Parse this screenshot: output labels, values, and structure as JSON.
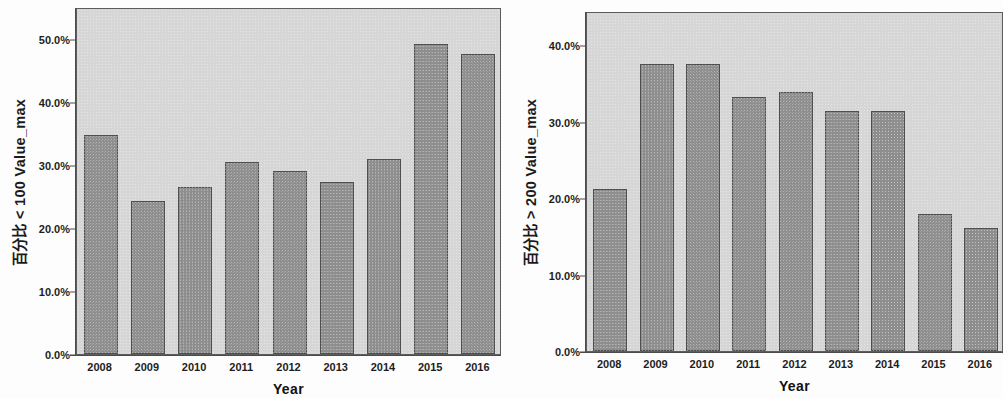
{
  "chart_data": [
    {
      "type": "bar",
      "panel": "left",
      "title": "",
      "categories": [
        "2008",
        "2009",
        "2010",
        "2011",
        "2012",
        "2013",
        "2014",
        "2015",
        "2016"
      ],
      "values": [
        34.7,
        24.3,
        26.4,
        30.5,
        29.0,
        27.3,
        30.9,
        49.2,
        47.5
      ],
      "xlabel": "Year",
      "ylabel": "百分比 < 100 Value_max",
      "ylim": [
        0,
        55
      ],
      "yticks": [
        0,
        10,
        20,
        30,
        40,
        50
      ],
      "ytick_labels": [
        "0.0%",
        "10.0%",
        "20.0%",
        "30.0%",
        "40.0%",
        "50.0%"
      ],
      "grid": false,
      "legend": "none",
      "bar_color": "#8e8e8e",
      "bar_edge_color": "#4f4f4f",
      "plot_background": "#d6d6d6"
    },
    {
      "type": "bar",
      "panel": "right",
      "title": "",
      "categories": [
        "2008",
        "2009",
        "2010",
        "2011",
        "2012",
        "2013",
        "2014",
        "2015",
        "2016"
      ],
      "values": [
        21.2,
        37.6,
        37.6,
        33.3,
        33.9,
        31.4,
        31.4,
        17.9,
        16.1
      ],
      "xlabel": "Year",
      "ylabel": "百分比 > 200 Value_max",
      "ylim": [
        0,
        44.5
      ],
      "yticks": [
        0,
        10,
        20,
        30,
        40
      ],
      "ytick_labels": [
        "0.0%",
        "10.0%",
        "20.0%",
        "30.0%",
        "40.0%"
      ],
      "grid": false,
      "legend": "none",
      "bar_color": "#8e8e8e",
      "bar_edge_color": "#4f4f4f",
      "plot_background": "#d6d6d6"
    }
  ],
  "left_chart": {
    "y_axis_title": "百分比 < 100 Value_max",
    "x_axis_title": "Year",
    "y_tick_labels": [
      "50.0%",
      "40.0%",
      "30.0%",
      "20.0%",
      "10.0%",
      "0.0%"
    ],
    "x_tick_labels": [
      "2008",
      "2009",
      "2010",
      "2011",
      "2012",
      "2013",
      "2014",
      "2015",
      "2016"
    ]
  },
  "right_chart": {
    "y_axis_title": "百分比 > 200 Value_max",
    "x_axis_title": "Year",
    "y_tick_labels": [
      "40.0%",
      "30.0%",
      "20.0%",
      "10.0%",
      "0.0%"
    ],
    "x_tick_labels": [
      "2008",
      "2009",
      "2010",
      "2011",
      "2012",
      "2013",
      "2014",
      "2015",
      "2016"
    ]
  }
}
